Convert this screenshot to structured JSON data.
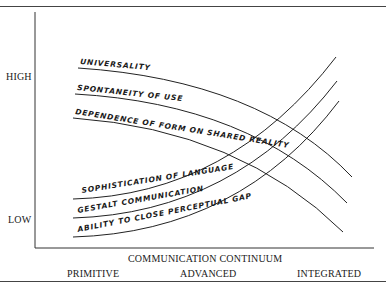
{
  "diagram": {
    "y_axis": {
      "high_label": "HIGH",
      "low_label": "LOW"
    },
    "x_axis": {
      "title": "COMMUNICATION CONTINUUM",
      "stages": [
        "PRIMITIVE",
        "ADVANCED",
        "INTEGRATED"
      ]
    },
    "declining_curves": [
      {
        "label": "UNIVERSALITY"
      },
      {
        "label": "SPONTANEITY OF USE"
      },
      {
        "label": "DEPENDENCE OF FORM ON SHARED REALITY"
      }
    ],
    "rising_curves": [
      {
        "label": "SOPHISTICATION OF LANGUAGE"
      },
      {
        "label": "GESTALT COMMUNICATION"
      },
      {
        "label": "ABILITY TO CLOSE PERCEPTUAL GAP"
      }
    ]
  }
}
